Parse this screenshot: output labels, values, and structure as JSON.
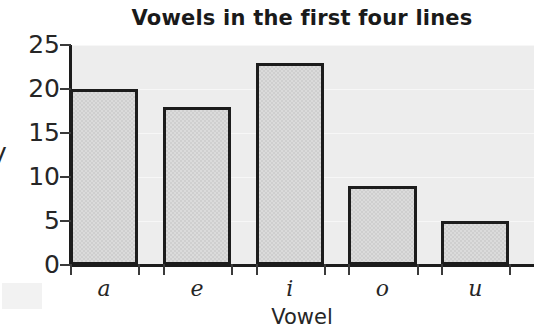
{
  "chart_data": {
    "type": "bar",
    "title": "Vowels in the first four lines",
    "xlabel": "Vowel",
    "ylabel": "y",
    "categories": [
      "a",
      "e",
      "i",
      "o",
      "u"
    ],
    "values": [
      20,
      18,
      23,
      9,
      5
    ],
    "yticks": [
      "0",
      "5",
      "10",
      "15",
      "20",
      "25"
    ],
    "ytick_values": [
      0,
      5,
      10,
      15,
      20,
      25
    ],
    "ylim": [
      0,
      25
    ],
    "grid": true,
    "legend": "none",
    "colors": {
      "bar_fill": "#cfcfcf",
      "bar_edge": "#1c1c1c",
      "plot_background": "#ededed",
      "gridline": "#f7f7f7",
      "text": "#262626",
      "figure_background": "#ffffff"
    }
  }
}
